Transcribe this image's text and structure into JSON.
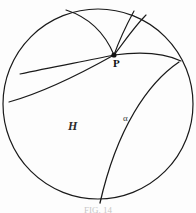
{
  "figure": {
    "kind": "poincare-disk-geodesics",
    "caption": "FIG. 14",
    "stroke_color": "#1a1a1a",
    "background_color": "#fdfdfd",
    "boundary": {
      "name": "disk-boundary-circle",
      "center_x": 98,
      "center_y": 104,
      "radius": 95
    },
    "labels": {
      "point_P": "P",
      "region_H": "H",
      "curve_alpha": "α"
    },
    "point_P_coords": {
      "x": 114,
      "y": 55
    },
    "geodesics": [
      {
        "name": "geodesic-P-to-top-left",
        "through_P": true,
        "path": "M 114 55 C 104 31 88 17 66 10"
      },
      {
        "name": "geodesic-P-to-top-right-inner",
        "through_P": true,
        "path": "M 114 55 C 120 38 127 24 134 11"
      },
      {
        "name": "geodesic-P-to-top-right-outer",
        "through_P": true,
        "path": "M 114 55 C 124 41 134 26 145 14"
      },
      {
        "name": "geodesic-P-to-right-edge",
        "through_P": true,
        "path": "M 114 55 C 136 52 158 51 180 60"
      },
      {
        "name": "geodesic-P-to-left-upper",
        "through_P": true,
        "path": "M 114 55 C 86 62 54 68 20 74"
      },
      {
        "name": "geodesic-P-to-left-lower",
        "through_P": true,
        "path": "M 114 55 C 82 74 46 92 9 103"
      },
      {
        "name": "geodesic-alpha-right-to-bottom",
        "through_P": false,
        "path": "M 178 62 C 146 84 116 130 100 203"
      }
    ]
  }
}
